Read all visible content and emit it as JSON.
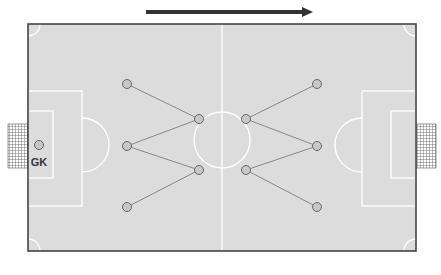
{
  "diagram": {
    "type": "soccer-formation",
    "direction_arrow": {
      "label": "attack-direction",
      "x1": 146,
      "x2": 312,
      "y": 12,
      "color": "#333333"
    },
    "colors": {
      "pitch": "#dcdcdc",
      "lines": "#ffffff",
      "border": "#444444",
      "player_fill": "#c8c8c8",
      "player_stroke": "#666666",
      "link": "#888888",
      "net": "#555555"
    },
    "goalkeeper": {
      "label": "GK",
      "x": 39,
      "y": 145
    },
    "players": [
      {
        "id": "L1",
        "x": 127,
        "y": 84
      },
      {
        "id": "L2",
        "x": 127,
        "y": 146
      },
      {
        "id": "L3",
        "x": 127,
        "y": 207
      },
      {
        "id": "M1",
        "x": 199,
        "y": 119
      },
      {
        "id": "M2",
        "x": 199,
        "y": 170
      },
      {
        "id": "M3",
        "x": 246,
        "y": 119
      },
      {
        "id": "M4",
        "x": 246,
        "y": 170
      },
      {
        "id": "R1",
        "x": 317,
        "y": 84
      },
      {
        "id": "R2",
        "x": 317,
        "y": 146
      },
      {
        "id": "R3",
        "x": 317,
        "y": 207
      }
    ],
    "links": [
      [
        "L1",
        "M1"
      ],
      [
        "L2",
        "M1"
      ],
      [
        "L2",
        "M2"
      ],
      [
        "L3",
        "M2"
      ],
      [
        "M3",
        "R1"
      ],
      [
        "M3",
        "R2"
      ],
      [
        "M4",
        "R2"
      ],
      [
        "M4",
        "R3"
      ]
    ]
  }
}
